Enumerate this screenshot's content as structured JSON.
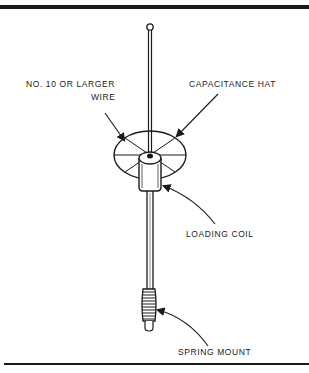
{
  "diagram": {
    "labels": {
      "wire": [
        "NO. 10 OR LARGER",
        "WIRE"
      ],
      "capacitance_hat": "CAPACITANCE HAT",
      "loading_coil": "LOADING COIL",
      "spring_mount": "SPRING MOUNT"
    },
    "colors": {
      "ink": "#1a1a1a",
      "background": "#ffffff"
    }
  }
}
